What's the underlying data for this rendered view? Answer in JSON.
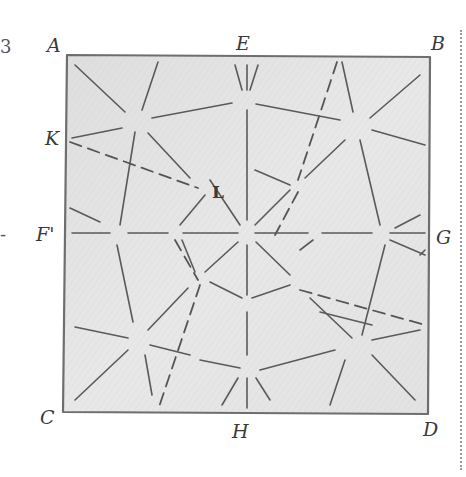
{
  "diagram": {
    "title": "",
    "style": "pencil sketch on shaded paper square",
    "colors": {
      "paper": "#e6e6e6",
      "paper_shade": "#dcdcdc",
      "border": "#6e6e6e",
      "line": "#5a5a5a",
      "label": "#3a3a3a"
    },
    "labels": {
      "A": "A",
      "B": "B",
      "C": "C",
      "D": "D",
      "E": "E",
      "F": "F'",
      "G": "G",
      "H": "H",
      "K": "K",
      "L": "L"
    },
    "edge_fragments": {
      "top_left": "3",
      "mid_left": "-"
    },
    "points": {
      "A": [
        67,
        55
      ],
      "B": [
        430,
        57
      ],
      "C": [
        63,
        412
      ],
      "D": [
        428,
        414
      ],
      "E": [
        245,
        55
      ],
      "F": [
        65,
        233
      ],
      "G": [
        430,
        234
      ],
      "H": [
        245,
        414
      ],
      "K": [
        67,
        140
      ],
      "L": [
        200,
        188
      ]
    },
    "solid_segments": [
      [
        [
          75,
          65
        ],
        [
          125,
          112
        ]
      ],
      [
        [
          158,
          62
        ],
        [
          142,
          110
        ]
      ],
      [
        [
          152,
          118
        ],
        [
          232,
          103
        ]
      ],
      [
        [
          72,
          138
        ],
        [
          122,
          128
        ]
      ],
      [
        [
          135,
          132
        ],
        [
          120,
          225
        ]
      ],
      [
        [
          148,
          133
        ],
        [
          190,
          178
        ]
      ],
      [
        [
          235,
          65
        ],
        [
          242,
          90
        ]
      ],
      [
        [
          247,
          65
        ],
        [
          247,
          90
        ]
      ],
      [
        [
          258,
          65
        ],
        [
          250,
          90
        ]
      ],
      [
        [
          247,
          110
        ],
        [
          247,
          220
        ]
      ],
      [
        [
          256,
          104
        ],
        [
          340,
          120
        ]
      ],
      [
        [
          342,
          62
        ],
        [
          353,
          112
        ]
      ],
      [
        [
          370,
          118
        ],
        [
          420,
          75
        ]
      ],
      [
        [
          372,
          130
        ],
        [
          425,
          145
        ]
      ],
      [
        [
          345,
          140
        ],
        [
          305,
          178
        ]
      ],
      [
        [
          360,
          140
        ],
        [
          380,
          225
        ]
      ],
      [
        [
          210,
          180
        ],
        [
          240,
          225
        ]
      ],
      [
        [
          255,
          225
        ],
        [
          290,
          190
        ]
      ],
      [
        [
          255,
          170
        ],
        [
          290,
          185
        ]
      ],
      [
        [
          205,
          195
        ],
        [
          180,
          225
        ]
      ],
      [
        [
          70,
          208
        ],
        [
          100,
          222
        ]
      ],
      [
        [
          395,
          228
        ],
        [
          420,
          215
        ]
      ],
      [
        [
          72,
          233
        ],
        [
          110,
          233
        ]
      ],
      [
        [
          128,
          233
        ],
        [
          168,
          233
        ]
      ],
      [
        [
          183,
          233
        ],
        [
          238,
          233
        ]
      ],
      [
        [
          255,
          233
        ],
        [
          308,
          233
        ]
      ],
      [
        [
          322,
          233
        ],
        [
          372,
          233
        ]
      ],
      [
        [
          390,
          233
        ],
        [
          425,
          233
        ]
      ],
      [
        [
          247,
          245
        ],
        [
          247,
          295
        ]
      ],
      [
        [
          238,
          242
        ],
        [
          205,
          272
        ]
      ],
      [
        [
          256,
          242
        ],
        [
          290,
          275
        ]
      ],
      [
        [
          182,
          240
        ],
        [
          195,
          272
        ]
      ],
      [
        [
          300,
          250
        ],
        [
          313,
          240
        ]
      ],
      [
        [
          390,
          240
        ],
        [
          425,
          255
        ]
      ],
      [
        [
          210,
          282
        ],
        [
          242,
          298
        ]
      ],
      [
        [
          252,
          298
        ],
        [
          290,
          285
        ]
      ],
      [
        [
          310,
          298
        ],
        [
          352,
          338
        ]
      ],
      [
        [
          385,
          245
        ],
        [
          362,
          335
        ]
      ],
      [
        [
          372,
          340
        ],
        [
          420,
          330
        ]
      ],
      [
        [
          320,
          312
        ],
        [
          372,
          325
        ]
      ],
      [
        [
          247,
          312
        ],
        [
          247,
          355
        ]
      ],
      [
        [
          188,
          288
        ],
        [
          148,
          330
        ]
      ],
      [
        [
          117,
          245
        ],
        [
          133,
          322
        ]
      ],
      [
        [
          75,
          327
        ],
        [
          128,
          338
        ]
      ],
      [
        [
          150,
          345
        ],
        [
          190,
          355
        ]
      ],
      [
        [
          128,
          350
        ],
        [
          75,
          400
        ]
      ],
      [
        [
          145,
          355
        ],
        [
          152,
          395
        ]
      ],
      [
        [
          200,
          360
        ],
        [
          240,
          368
        ]
      ],
      [
        [
          260,
          370
        ],
        [
          335,
          350
        ]
      ],
      [
        [
          238,
          378
        ],
        [
          222,
          405
        ]
      ],
      [
        [
          247,
          378
        ],
        [
          247,
          408
        ]
      ],
      [
        [
          256,
          378
        ],
        [
          270,
          400
        ]
      ],
      [
        [
          345,
          360
        ],
        [
          330,
          405
        ]
      ],
      [
        [
          372,
          355
        ],
        [
          415,
          400
        ]
      ],
      [
        [
          420,
          255
        ],
        [
          425,
          250
        ]
      ]
    ],
    "dashed_segments": [
      [
        [
          70,
          142
        ],
        [
          198,
          188
        ]
      ],
      [
        [
          337,
          62
        ],
        [
          298,
          180
        ]
      ],
      [
        [
          298,
          192
        ],
        [
          275,
          235
        ]
      ],
      [
        [
          300,
          290
        ],
        [
          425,
          325
        ]
      ],
      [
        [
          200,
          285
        ],
        [
          158,
          410
        ]
      ],
      [
        [
          175,
          240
        ],
        [
          198,
          280
        ]
      ]
    ]
  }
}
